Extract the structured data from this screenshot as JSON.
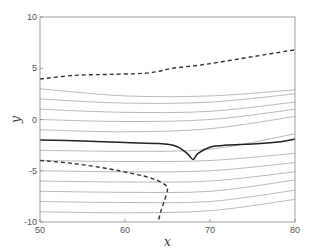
{
  "chart_data": {
    "type": "line",
    "title": "",
    "xlabel": "x",
    "ylabel": "y",
    "xlim": [
      50,
      80
    ],
    "ylim": [
      -10,
      10
    ],
    "xticks": [
      50,
      60,
      70,
      80
    ],
    "yticks": [
      -10,
      -5,
      0,
      5,
      10
    ],
    "xtick_labels": [
      "50",
      "60",
      "70",
      "80"
    ],
    "ytick_labels": [
      "-10",
      "-5",
      "0",
      "5",
      "10"
    ],
    "grid": false,
    "legend": null,
    "series": [
      {
        "name": "upper-dashed",
        "style": "dashed",
        "color": "#333333",
        "x": [
          50,
          54,
          58,
          62,
          64,
          65.6,
          69.6,
          75.5,
          80
        ],
        "y": [
          3.95,
          4.3,
          4.4,
          4.5,
          4.7,
          5.0,
          5.4,
          6.2,
          6.8
        ]
      },
      {
        "name": "main-solid",
        "style": "solid",
        "color": "#222222",
        "x": [
          50,
          55,
          60,
          64,
          66,
          67.3,
          68,
          68.6,
          70,
          72,
          75,
          78,
          80
        ],
        "y": [
          -2.0,
          -2.1,
          -2.25,
          -2.35,
          -2.6,
          -3.3,
          -3.9,
          -3.3,
          -2.7,
          -2.5,
          -2.4,
          -2.2,
          -1.9
        ]
      },
      {
        "name": "lower-dashed",
        "style": "dashed",
        "color": "#333333",
        "x": [
          50,
          54,
          58,
          61,
          63,
          64.6,
          65.0,
          64.6,
          64.2,
          63.9
        ],
        "y": [
          -4.0,
          -4.3,
          -4.8,
          -5.3,
          -5.7,
          -6.3,
          -6.8,
          -8.0,
          -9.0,
          -10.0
        ]
      },
      {
        "name": "gray-1",
        "style": "solid",
        "color": "#b0b0b0",
        "x": [
          50,
          60,
          70,
          80
        ],
        "y": [
          3.0,
          2.3,
          2.3,
          2.9
        ]
      },
      {
        "name": "gray-2",
        "style": "solid",
        "color": "#b0b0b0",
        "x": [
          50,
          60,
          70,
          80
        ],
        "y": [
          2.0,
          1.6,
          1.7,
          2.5
        ]
      },
      {
        "name": "gray-3",
        "style": "solid",
        "color": "#b0b0b0",
        "x": [
          50,
          60,
          70,
          80
        ],
        "y": [
          1.0,
          0.7,
          0.8,
          1.7
        ]
      },
      {
        "name": "gray-4",
        "style": "solid",
        "color": "#b0b0b0",
        "x": [
          50,
          60,
          70,
          80
        ],
        "y": [
          0.0,
          -0.2,
          0.0,
          1.0
        ]
      },
      {
        "name": "gray-5",
        "style": "solid",
        "color": "#b0b0b0",
        "x": [
          50,
          60,
          70,
          80
        ],
        "y": [
          -1.0,
          -1.2,
          -0.9,
          0.3
        ]
      },
      {
        "name": "gray-6",
        "style": "solid",
        "color": "#b0b0b0",
        "x": [
          50,
          60,
          70,
          80
        ],
        "y": [
          -3.0,
          -3.1,
          -2.9,
          -1.4
        ]
      },
      {
        "name": "gray-7",
        "style": "solid",
        "color": "#b0b0b0",
        "x": [
          50,
          60,
          70,
          80
        ],
        "y": [
          -4.0,
          -4.1,
          -4.0,
          -3.3
        ]
      },
      {
        "name": "gray-8",
        "style": "solid",
        "color": "#b0b0b0",
        "x": [
          50,
          60,
          70,
          80
        ],
        "y": [
          -5.0,
          -5.1,
          -5.0,
          -4.2
        ]
      },
      {
        "name": "gray-9",
        "style": "solid",
        "color": "#b0b0b0",
        "x": [
          50,
          60,
          70,
          80
        ],
        "y": [
          -6.0,
          -6.1,
          -6.0,
          -5.1
        ]
      },
      {
        "name": "gray-10",
        "style": "solid",
        "color": "#b0b0b0",
        "x": [
          50,
          60,
          70,
          80
        ],
        "y": [
          -7.0,
          -7.1,
          -7.0,
          -5.9
        ]
      },
      {
        "name": "gray-11",
        "style": "solid",
        "color": "#b0b0b0",
        "x": [
          50,
          60,
          70,
          80
        ],
        "y": [
          -8.0,
          -8.1,
          -8.0,
          -6.9
        ]
      },
      {
        "name": "gray-12",
        "style": "solid",
        "color": "#b0b0b0",
        "x": [
          50,
          60,
          70,
          80
        ],
        "y": [
          -9.0,
          -9.1,
          -8.9,
          -7.8
        ]
      }
    ]
  },
  "layout": {
    "plot_left": 40,
    "plot_right": 295,
    "plot_top": 17,
    "plot_bottom": 222,
    "axis_color": "#888888"
  }
}
